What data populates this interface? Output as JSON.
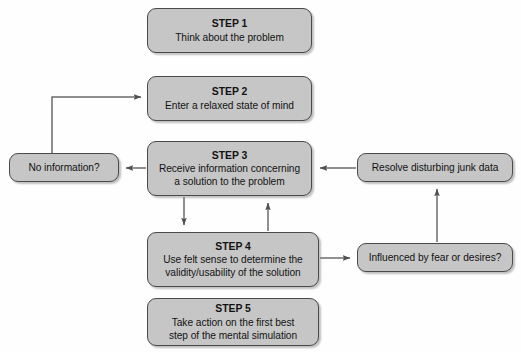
{
  "diagram": {
    "background_color": "#ffffff",
    "box_fill_color": "#c6c6c6",
    "box_border_color": "#4a4a4a",
    "connector_color": "#555555",
    "steps": [
      {
        "id": "step1",
        "title": "STEP 1",
        "body": "Think about the problem"
      },
      {
        "id": "step2",
        "title": "STEP 2",
        "body": "Enter a relaxed state of mind"
      },
      {
        "id": "step3",
        "title": "STEP 3",
        "body": "Receive information concerning\na solution to the problem"
      },
      {
        "id": "step4",
        "title": "STEP 4",
        "body": "Use felt sense to determine the\nvalidity/usability of the solution"
      },
      {
        "id": "step5",
        "title": "STEP 5",
        "body": "Take action on the first best\nstep of the mental simulation"
      }
    ],
    "side_nodes": [
      {
        "id": "noinfo",
        "label": "No information?"
      },
      {
        "id": "resolve",
        "label": "Resolve disturbing junk data"
      },
      {
        "id": "influenced",
        "label": "Influenced by fear or desires?"
      }
    ],
    "connectors": [
      {
        "id": "noinfo-to-step2",
        "from": "No information?",
        "to": "STEP 2",
        "arrow": "to-target"
      },
      {
        "id": "step3-to-noinfo",
        "from": "STEP 3",
        "to": "No information?",
        "arrow": "to-target"
      },
      {
        "id": "step3-to-step4",
        "from": "STEP 3",
        "to": "STEP 4",
        "arrow": "to-target"
      },
      {
        "id": "step4-to-step3",
        "from": "STEP 4",
        "to": "STEP 3",
        "arrow": "to-target"
      },
      {
        "id": "resolve-to-step3",
        "from": "Resolve disturbing junk data",
        "to": "STEP 3",
        "arrow": "to-target"
      },
      {
        "id": "step4-to-influenced",
        "from": "STEP 4",
        "to": "Influenced by fear or desires?",
        "arrow": "to-target"
      },
      {
        "id": "influenced-to-resolve",
        "from": "Influenced by fear or desires?",
        "to": "Resolve disturbing junk data",
        "arrow": "to-target"
      }
    ]
  }
}
